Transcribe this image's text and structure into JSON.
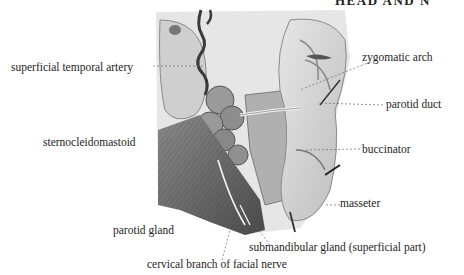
{
  "header": {
    "running_title": "HEAD AND N"
  },
  "figure": {
    "labels": {
      "superficial_temporal_artery": "superficial temporal artery",
      "zygomatic_arch": "zygomatic arch",
      "parotid_duct": "parotid duct",
      "sternocleidomastoid": "sternocleidomastoid",
      "buccinator": "buccinator",
      "masseter": "masseter",
      "parotid_gland": "parotid gland",
      "submandibular_gland": "submandibular gland (superficial part)",
      "cervical_branch": "cervical branch of facial nerve"
    }
  }
}
